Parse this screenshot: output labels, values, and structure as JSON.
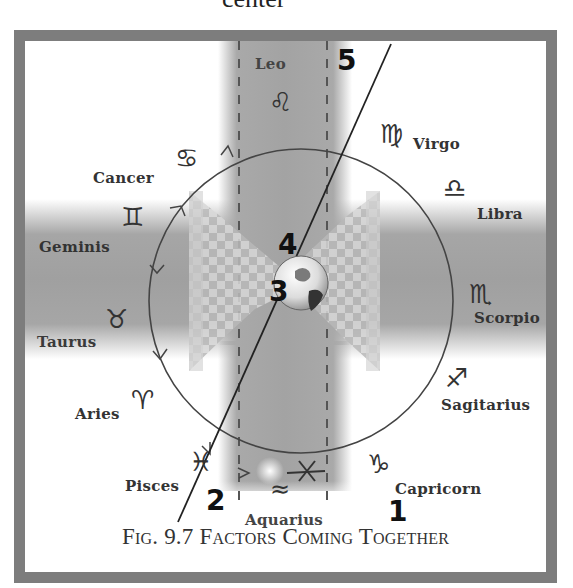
{
  "page": {
    "top_text": "center"
  },
  "figure": {
    "caption": "Fig. 9.7 Factors Coming Together",
    "zodiac": [
      {
        "name": "Leo",
        "glyph": "♌"
      },
      {
        "name": "Virgo",
        "glyph": "♍"
      },
      {
        "name": "Libra",
        "glyph": "♎"
      },
      {
        "name": "Scorpio",
        "glyph": "♏"
      },
      {
        "name": "Sagitarius",
        "glyph": "♐"
      },
      {
        "name": "Capricorn",
        "glyph": "♑"
      },
      {
        "name": "Aquarius",
        "glyph": "≈"
      },
      {
        "name": "Pisces",
        "glyph": "♓"
      },
      {
        "name": "Aries",
        "glyph": "♈"
      },
      {
        "name": "Taurus",
        "glyph": "♉"
      },
      {
        "name": "Geminis",
        "glyph": "♊"
      },
      {
        "name": "Cancer",
        "glyph": "♋"
      }
    ],
    "markers": [
      "1",
      "2",
      "3",
      "4",
      "5"
    ],
    "colors": {
      "frame": "#7d7d7d",
      "band": "#a6a6a6",
      "line": "#222222",
      "text": "#333333"
    }
  }
}
